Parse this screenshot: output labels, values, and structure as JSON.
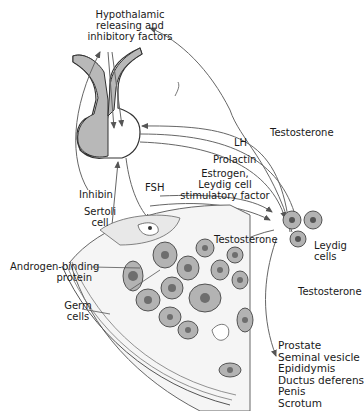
{
  "diagram": {
    "colors": {
      "gland_fill": "#b8b8b8",
      "cell_fill": "#b3b3b3",
      "nucleus_fill": "#6e6e6e",
      "line": "#555555",
      "text": "#1a1a1a"
    },
    "labels": {
      "hypothalamic": [
        "Hypothalamic",
        "releasing and",
        "inhibitory factors"
      ],
      "testosterone_feedback": "Testosterone",
      "lh": "LH",
      "prolactin": "Prolactin",
      "estrogen": [
        "Estrogen,",
        "Leydig cell",
        "stimulatory factor"
      ],
      "fsh": "FSH",
      "inhibin": "Inhibin",
      "sertoli": [
        "Sertoli",
        "cell"
      ],
      "testosterone_local": "Testosterone",
      "leydig": [
        "Leydig",
        "cells"
      ],
      "androgen_binding": [
        "Androgen-binding",
        "protein"
      ],
      "germ": [
        "Germ",
        "cells"
      ],
      "testosterone_peripheral": "Testosterone",
      "targets": [
        "Prostate",
        "Seminal vesicle",
        "Epididymis",
        "Ductus deferens",
        "Penis",
        "Scrotum"
      ]
    }
  }
}
